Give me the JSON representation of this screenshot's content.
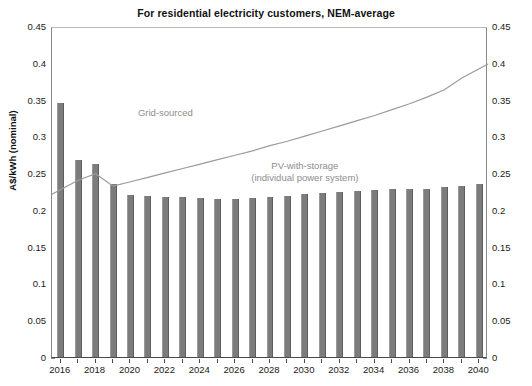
{
  "chart_data": {
    "type": "bar",
    "title": "For residential electricity customers, NEM-average",
    "xlabel": "",
    "ylabel": "A$/kWh (nominal)",
    "ylim": [
      0,
      0.45
    ],
    "ytick_values": [
      0,
      0.05,
      0.1,
      0.15,
      0.2,
      0.25,
      0.3,
      0.35,
      0.4,
      0.45
    ],
    "ytick_labels": [
      "0",
      "0.05",
      "0.1",
      "0.15",
      "0.2",
      "0.25",
      "0.3",
      "0.35",
      "0.4",
      "0.45"
    ],
    "ytick_labels_right": [
      "0",
      "0.05",
      "0.1",
      "0.15",
      "0.2",
      "0.25",
      "0.3",
      "0.35",
      "0.4",
      "0.45"
    ],
    "grid": false,
    "legend_position": "inline-annotations",
    "categories": [
      "2016",
      "2017",
      "2018",
      "2019",
      "2020",
      "2021",
      "2022",
      "2023",
      "2024",
      "2025",
      "2026",
      "2027",
      "2028",
      "2029",
      "2030",
      "2031",
      "2032",
      "2033",
      "2034",
      "2035",
      "2036",
      "2037",
      "2038",
      "2039",
      "2040"
    ],
    "xtick_labels": [
      "2016",
      "2018",
      "2020",
      "2022",
      "2024",
      "2026",
      "2028",
      "2030",
      "2032",
      "2034",
      "2036",
      "2038",
      "2040"
    ],
    "series": [
      {
        "name": "PV-with-storage (individual power system)",
        "render": "bar",
        "color": "#7c7c7c",
        "values": [
          0.345,
          0.268,
          0.263,
          0.235,
          0.22,
          0.219,
          0.218,
          0.217,
          0.216,
          0.215,
          0.215,
          0.216,
          0.218,
          0.219,
          0.221,
          0.223,
          0.225,
          0.226,
          0.227,
          0.228,
          0.229,
          0.229,
          0.231,
          0.233,
          0.235
        ]
      },
      {
        "name": "Grid-sourced",
        "render": "line",
        "color": "#9b9b9b",
        "values": [
          0.224,
          0.243,
          0.252,
          0.235,
          0.241,
          0.247,
          0.253,
          0.259,
          0.265,
          0.271,
          0.277,
          0.283,
          0.29,
          0.296,
          0.303,
          0.31,
          0.317,
          0.324,
          0.331,
          0.339,
          0.347,
          0.356,
          0.366,
          0.382,
          0.401
        ]
      }
    ],
    "annotations": [
      {
        "text": "Grid-sourced",
        "x_value": "2022",
        "y_value": 0.335
      },
      {
        "text": "PV-with-storage",
        "x_value": "2030",
        "y_value": 0.262
      },
      {
        "text": "(individual power system)",
        "x_value": "2030",
        "y_value": 0.246
      }
    ]
  }
}
